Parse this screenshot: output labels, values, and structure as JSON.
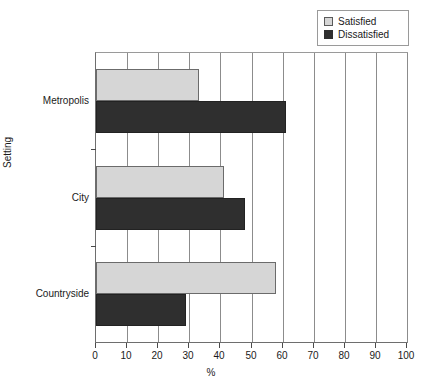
{
  "chart_data": {
    "type": "bar",
    "orientation": "horizontal",
    "title": "",
    "xlabel": "%",
    "ylabel": "Setting",
    "categories": [
      "Metropolis",
      "City",
      "Countryside"
    ],
    "series": [
      {
        "name": "Satisfied",
        "color": "#d6d6d6",
        "values": [
          33,
          41,
          58
        ]
      },
      {
        "name": "Dissatisfied",
        "color": "#2f2f2f",
        "values": [
          61,
          48,
          29
        ]
      }
    ],
    "xlim": [
      0,
      100
    ],
    "xticks": [
      0,
      10,
      20,
      30,
      40,
      50,
      60,
      70,
      80,
      90,
      100
    ],
    "xtick_labels": [
      "0",
      "10",
      "20",
      "30",
      "40",
      "50",
      "60",
      "70",
      "80",
      "90",
      "100"
    ],
    "grid": "vertical",
    "legend_position": "top-right"
  },
  "legend": {
    "items": [
      {
        "label": "Satisfied",
        "swatch": "satisfied-swatch-icon"
      },
      {
        "label": "Dissatisfied",
        "swatch": "dissatisfied-swatch-icon"
      }
    ]
  },
  "axes": {
    "x_title": "%",
    "y_title": "Setting"
  }
}
